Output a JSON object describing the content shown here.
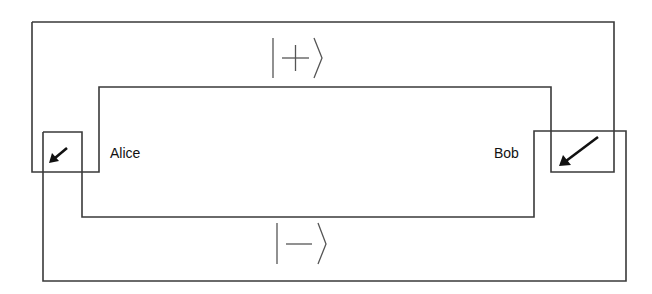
{
  "diagram": {
    "type": "quantum-channel-loop",
    "parties": {
      "left": {
        "label": "Alice"
      },
      "right": {
        "label": "Bob"
      }
    },
    "states": {
      "upper": {
        "label": "|+⟩",
        "symbol": "+"
      },
      "lower": {
        "label": "|−⟩",
        "symbol": "−"
      }
    },
    "colors": {
      "line": "#3a3a3a",
      "arrow": "#111111",
      "ket": "#555555",
      "background": "#ffffff"
    },
    "icons": {
      "alice_device": "diagonal-arrow-down-left-icon",
      "bob_device": "diagonal-arrow-down-left-icon"
    }
  }
}
